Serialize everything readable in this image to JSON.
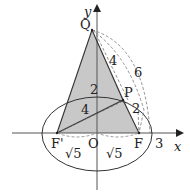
{
  "figure": {
    "axes": {
      "x_label": "x",
      "y_label": "y",
      "origin_label": "O"
    },
    "points": {
      "Q": "Q",
      "P": "P",
      "F_left": "F'",
      "F_right": "F"
    },
    "lengths": {
      "QP": "4",
      "arc_radius": "6",
      "PF": "2",
      "OP_segment": "2",
      "FP_left": "4",
      "OF_left": "√5",
      "OF_right": "√5",
      "x_intercept": "3"
    },
    "colors": {
      "shade": "#c8c8c8",
      "line": "#333333",
      "dash": "#777777"
    }
  }
}
